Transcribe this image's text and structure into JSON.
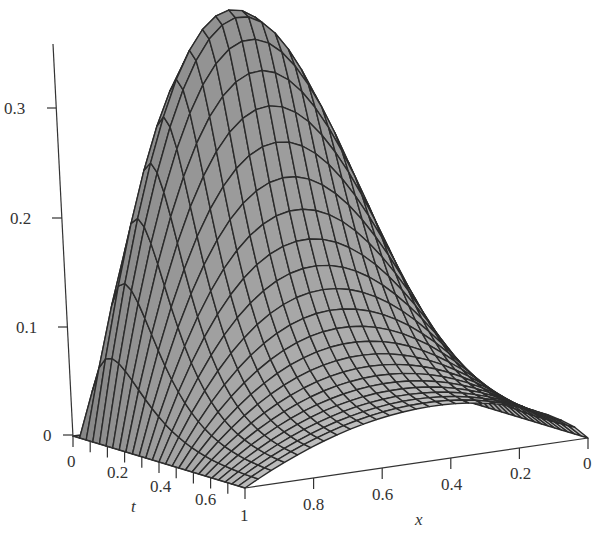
{
  "chart_data": {
    "type": "surface",
    "title": "",
    "function_description": "3D mesh surface z = u(x, t) over x in [0,1], t in [0,1]",
    "axes": {
      "z": {
        "label": "",
        "ticks": [
          0,
          0.1,
          0.2,
          0.3
        ],
        "tick_labels": [
          "0",
          "0.1",
          "0.2",
          "0.3"
        ],
        "range": [
          0,
          0.38
        ]
      },
      "t": {
        "label": "t",
        "ticks": [
          0,
          0.2,
          0.4,
          0.6
        ],
        "tick_labels": [
          "0",
          "0.2",
          "0.4",
          "0.6"
        ],
        "minor_ticks": [
          0.1,
          0.3,
          0.5,
          0.7,
          0.8,
          0.9
        ],
        "range": [
          0,
          1
        ]
      },
      "x": {
        "label": "x",
        "ticks": [
          1,
          0.8,
          0.6,
          0.4,
          0.2,
          0
        ],
        "tick_labels": [
          "1",
          "0.8",
          "0.6",
          "0.4",
          "0.2",
          "0"
        ],
        "range": [
          0,
          1
        ]
      }
    },
    "peak": {
      "x": 0.64,
      "t": 0.16,
      "z": 0.375
    },
    "edge_t1_peak": {
      "x": 0.45,
      "z": 0.05
    },
    "mesh": {
      "x_lines": 26,
      "t_lines": 26
    },
    "colors": {
      "surface_fill_dark": "#858585",
      "surface_fill_light": "#cfcfcf",
      "mesh_line": "#2b2b2b",
      "axis": "#333333"
    },
    "grid": false,
    "legend": null
  },
  "labels": {
    "z0": "0",
    "z1": "0.1",
    "z2": "0.2",
    "z3": "0.3",
    "t0": "0",
    "t2": "0.2",
    "t4": "0.4",
    "t6": "0.6",
    "t_title": "t",
    "x10": "1",
    "x8": "0.8",
    "x6": "0.6",
    "x4": "0.4",
    "x2": "0.2",
    "x0": "0",
    "x_title": "x"
  }
}
